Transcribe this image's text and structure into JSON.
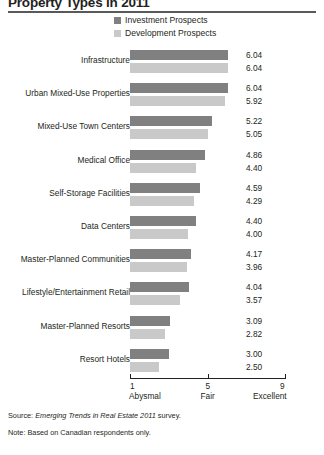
{
  "title": "Property Types in 2011",
  "legend": {
    "position": "top-center",
    "items": [
      {
        "label": "Investment Prospects",
        "color": "#808080",
        "key": "investment"
      },
      {
        "label": "Development Prospects",
        "color": "#c9c9c9",
        "key": "development"
      }
    ]
  },
  "axis": {
    "ticks": [
      {
        "value": 1,
        "number": "1",
        "word": "Abysmal"
      },
      {
        "value": 5,
        "number": "5",
        "word": "Fair"
      },
      {
        "value": 9,
        "number": "9",
        "word": "Excellent"
      }
    ]
  },
  "footnotes": {
    "source_prefix": "Source: ",
    "source_italic": "Emerging Trends in Real Estate 2011",
    "source_suffix": " survey.",
    "note": "Note: Based on Canadian respondents only."
  },
  "chart_data": {
    "type": "bar",
    "orientation": "horizontal",
    "title": "Property Types in 2011",
    "xlabel": "",
    "ylabel": "",
    "xlim": [
      1,
      9
    ],
    "xticks": [
      1,
      5,
      9
    ],
    "xtick_labels": [
      "1 Abysmal",
      "5 Fair",
      "9 Excellent"
    ],
    "grid": false,
    "legend_position": "top-center",
    "categories": [
      "Infrastructure",
      "Urban Mixed-Use Properties",
      "Mixed-Use Town Centers",
      "Medical Office",
      "Self-Storage Facilities",
      "Data Centers",
      "Master-Planned Communities",
      "Lifestyle/Entertainment Retail",
      "Master-Planned Resorts",
      "Resort Hotels"
    ],
    "series": [
      {
        "name": "Investment Prospects",
        "color": "#808080",
        "values": [
          6.04,
          6.04,
          5.22,
          4.86,
          4.59,
          4.4,
          4.17,
          4.04,
          3.09,
          3.0
        ],
        "labels": [
          "6.04",
          "6.04",
          "5.22",
          "4.86",
          "4.59",
          "4.40",
          "4.17",
          "4.04",
          "3.09",
          "3.00"
        ]
      },
      {
        "name": "Development Prospects",
        "color": "#c9c9c9",
        "values": [
          6.04,
          5.92,
          5.05,
          4.4,
          4.29,
          4.0,
          3.96,
          3.57,
          2.82,
          2.5
        ],
        "labels": [
          "6.04",
          "5.92",
          "5.05",
          "4.40",
          "4.29",
          "4.00",
          "3.96",
          "3.57",
          "2.82",
          "2.50"
        ]
      }
    ]
  }
}
